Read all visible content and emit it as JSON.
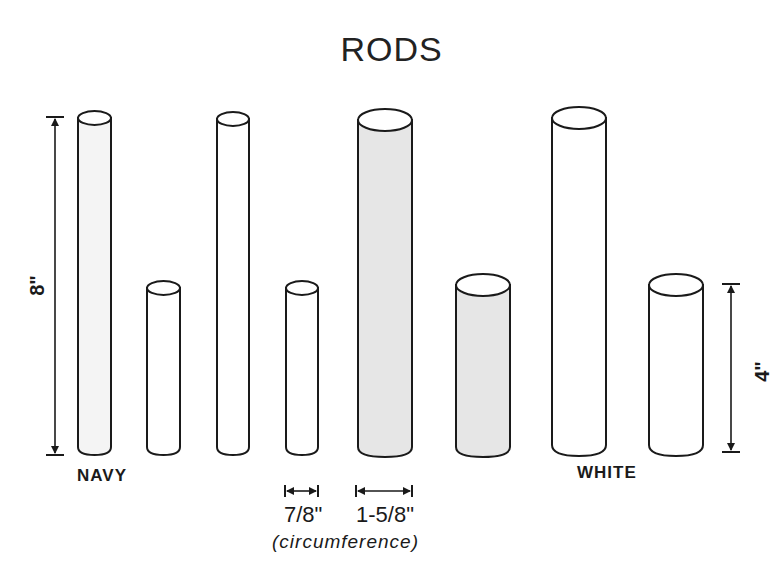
{
  "title": "RODS",
  "groups": [
    {
      "label": "NAVY",
      "color": "navy"
    },
    {
      "label": "WHITE",
      "color": "white"
    }
  ],
  "dimensions": {
    "height_tall": "8\"",
    "height_short": "4\"",
    "circumference_thin": "7/8\"",
    "circumference_thick": "1-5/8\"",
    "circumference_note": "(circumference)"
  },
  "rods": [
    {
      "group": "navy",
      "length": "8\"",
      "circumference": "7/8\"",
      "x": 78,
      "w": 33,
      "top": 118,
      "fill": "#f4f4f4"
    },
    {
      "group": "navy",
      "length": "4\"",
      "circumference": "7/8\"",
      "x": 147,
      "w": 33,
      "top": 288,
      "fill": "#ffffff"
    },
    {
      "group": "white",
      "length": "8\"",
      "circumference": "7/8\"",
      "x": 217,
      "w": 32,
      "top": 118,
      "fill": "#ffffff"
    },
    {
      "group": "white",
      "length": "4\"",
      "circumference": "7/8\"",
      "x": 286,
      "w": 32,
      "top": 288,
      "fill": "#ffffff"
    },
    {
      "group": "navy",
      "length": "8\"",
      "circumference": "1-5/8\"",
      "x": 358,
      "w": 54,
      "top": 118,
      "fill": "#e6e6e6"
    },
    {
      "group": "navy",
      "length": "4\"",
      "circumference": "1-5/8\"",
      "x": 456,
      "w": 54,
      "top": 285,
      "fill": "#e6e6e6"
    },
    {
      "group": "white",
      "length": "8\"",
      "circumference": "1-5/8\"",
      "x": 552,
      "w": 54,
      "top": 118,
      "fill": "#ffffff"
    },
    {
      "group": "white",
      "length": "4\"",
      "circumference": "1-5/8\"",
      "x": 649,
      "w": 54,
      "top": 285,
      "fill": "#ffffff"
    }
  ],
  "colors": {
    "stroke": "#1a1a1a",
    "shade": "#e6e6e6",
    "background": "#ffffff"
  }
}
